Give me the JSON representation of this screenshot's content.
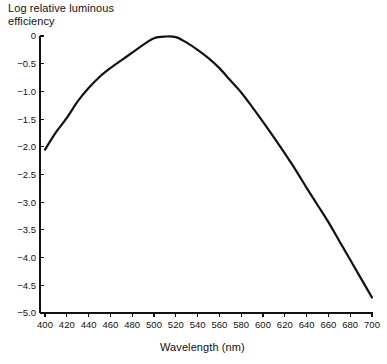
{
  "chart_data": {
    "type": "line",
    "title": "",
    "xlabel": "Wavelength (nm)",
    "ylabel": "Log relative luminous\nefficiency",
    "xlim": [
      400,
      700
    ],
    "ylim": [
      -5.0,
      0.0
    ],
    "grid": false,
    "legend": "none",
    "xticks": [
      400,
      420,
      440,
      460,
      480,
      500,
      520,
      540,
      560,
      580,
      600,
      620,
      640,
      660,
      680,
      700
    ],
    "xticklabels": [
      "400",
      "420",
      "440",
      "460",
      "480",
      "500",
      "520",
      "540",
      "560",
      "580",
      "600",
      "620",
      "640",
      "660",
      "680",
      "700"
    ],
    "yticks": [
      0,
      -0.5,
      -1.0,
      -1.5,
      -2.0,
      -2.5,
      -3.0,
      -3.5,
      -4.0,
      -4.5,
      -5.0
    ],
    "yticklabels": [
      "0",
      "−0.5",
      "−1.0",
      "−1.5",
      "−2.0",
      "−2.5",
      "−3.0",
      "−3.5",
      "−4.0",
      "−4.5",
      "−5.0"
    ],
    "series": [
      {
        "name": "Log relative luminous efficiency",
        "color": "#111111",
        "x": [
          400,
          410,
          420,
          430,
          440,
          450,
          460,
          470,
          480,
          490,
          500,
          510,
          520,
          530,
          540,
          550,
          560,
          570,
          580,
          590,
          600,
          610,
          620,
          630,
          640,
          650,
          660,
          670,
          680,
          690,
          700
        ],
        "y": [
          -2.05,
          -1.74,
          -1.48,
          -1.18,
          -0.94,
          -0.74,
          -0.58,
          -0.44,
          -0.3,
          -0.16,
          -0.04,
          -0.01,
          -0.02,
          -0.12,
          -0.25,
          -0.4,
          -0.58,
          -0.8,
          -1.02,
          -1.28,
          -1.55,
          -1.83,
          -2.12,
          -2.42,
          -2.74,
          -3.05,
          -3.36,
          -3.7,
          -4.04,
          -4.38,
          -4.72
        ]
      }
    ]
  },
  "axes": {
    "y_title_text": "Log relative luminous\nefficiency",
    "x_title_text": "Wavelength (nm)"
  },
  "colors": {
    "curve": "#111111",
    "axis": "#111111",
    "background": "#ffffff"
  }
}
